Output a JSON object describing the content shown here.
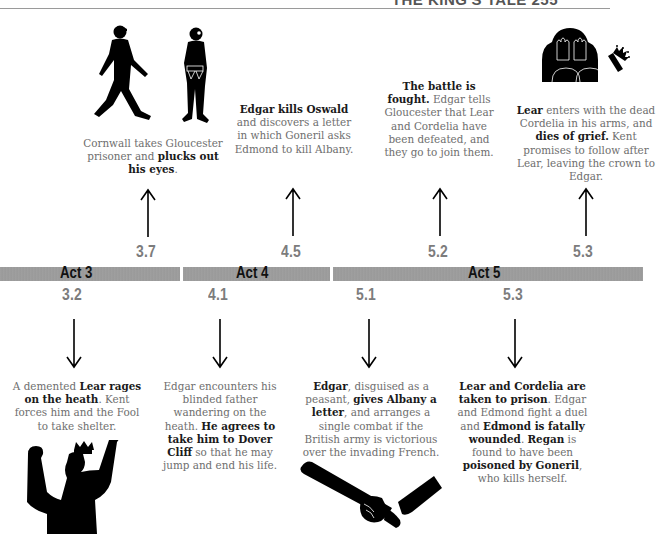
{
  "page_header": {
    "title": "THE KING'S TALE 255"
  },
  "timeline": {
    "acts": [
      {
        "label": "Act 3"
      },
      {
        "label": "Act 4"
      },
      {
        "label": "Act 5"
      }
    ],
    "above": [
      {
        "scene": "3.7",
        "illustration": "gloucester-prisoner-figures",
        "text": [
          {
            "t": "Cornwall takes Gloucester prisoner and ",
            "b": false
          },
          {
            "t": "plucks out his eyes",
            "b": true
          },
          {
            "t": ".",
            "b": false
          }
        ]
      },
      {
        "scene": "4.5",
        "illustration": "",
        "text": [
          {
            "t": "Edgar kills Oswald",
            "b": true
          },
          {
            "t": " and discovers a letter in which Goneril asks Edmond to kill Albany.",
            "b": false
          }
        ]
      },
      {
        "scene": "5.2",
        "illustration": "",
        "text": [
          {
            "t": "The battle is fought.",
            "b": true
          },
          {
            "t": " Edgar tells Gloucester that Lear and Cordelia have been defeated, and they go to join them.",
            "b": false
          }
        ]
      },
      {
        "scene": "5.3",
        "illustration": "grieving-figure-with-crown",
        "text": [
          {
            "t": "Lear",
            "b": true
          },
          {
            "t": " enters with the dead Cordelia in his arms, and ",
            "b": false
          },
          {
            "t": "dies of grief.",
            "b": true
          },
          {
            "t": " Kent promises to follow after Lear, leaving the crown to Edgar.",
            "b": false
          }
        ]
      }
    ],
    "below": [
      {
        "scene": "3.2",
        "illustration": "raging-king-lear",
        "text": [
          {
            "t": "A demented ",
            "b": false
          },
          {
            "t": "Lear rages on the heath",
            "b": true
          },
          {
            "t": ". Kent forces him and the Fool to take shelter.",
            "b": false
          }
        ]
      },
      {
        "scene": "4.1",
        "illustration": "",
        "text": [
          {
            "t": "Edgar encounters his blinded father wandering on the heath. ",
            "b": false
          },
          {
            "t": "He agrees to take him to Dover Cliff",
            "b": true
          },
          {
            "t": " so that he may jump and end his life.",
            "b": false
          }
        ]
      },
      {
        "scene": "5.1",
        "illustration": "hand-holding-letter-scroll",
        "text": [
          {
            "t": "Edgar",
            "b": true
          },
          {
            "t": ", disguised as a peasant, ",
            "b": false
          },
          {
            "t": "gives Albany a letter",
            "b": true
          },
          {
            "t": ", and arranges a single combat if the British army is victorious over the invading French.",
            "b": false
          }
        ]
      },
      {
        "scene": "5.3",
        "illustration": "",
        "text": [
          {
            "t": "Lear and Cordelia are taken to prison",
            "b": true
          },
          {
            "t": ". Edgar and Edmond fight a duel and ",
            "b": false
          },
          {
            "t": "Edmond is fatally wounded",
            "b": true
          },
          {
            "t": ". ",
            "b": false
          },
          {
            "t": "Regan",
            "b": true
          },
          {
            "t": " is found to have been ",
            "b": false
          },
          {
            "t": "poisoned by Goneril",
            "b": true
          },
          {
            "t": ", who kills herself.",
            "b": false
          }
        ]
      }
    ]
  },
  "colors": {
    "bar": "#9b9b9b",
    "scene_number": "#7c7c7c",
    "body_text": "#6e6e6e",
    "bold_text": "#1a1a1a",
    "ink": "#000000"
  }
}
